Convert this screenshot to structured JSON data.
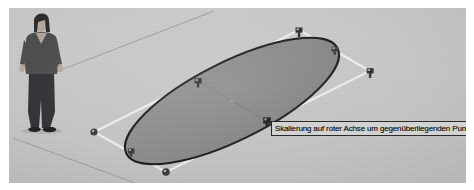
{
  "application": {
    "name": "SketchUp",
    "tool": "scale-tool",
    "language": "de"
  },
  "tooltip": {
    "text": "Skalierung auf roter Achse um gegenüberliegenden Punkt",
    "background_color": "#d2d2d2",
    "border_color": "#2a2a2a",
    "text_color": "#1a1a1a"
  },
  "viewport": {
    "background_color": "#c9c9c9",
    "page_background_color": "#ffffff",
    "ground_line_color": "#8d8d8d"
  },
  "scale_figure": {
    "label": "human-scale-figure",
    "description": "stehende Person",
    "sweater_color": "#4a4a4a",
    "trousers_color": "#2f3034",
    "skin_color": "#b9aca2",
    "hair_color": "#2b2b2b",
    "shoes_color": "#26262a"
  },
  "selection": {
    "label": "ellipse-face",
    "fill_color": "#8b8b8b",
    "edge_color": "#1c1c1c",
    "bounding_box_color": "#f0f0f0",
    "axis_guide_color": "#7a7a7a"
  },
  "scale_grips": [
    {
      "id": "grip-top-mid",
      "type": "cube",
      "state": "idle",
      "x": 290,
      "y": 22
    },
    {
      "id": "grip-top-right",
      "type": "cube",
      "state": "idle",
      "x": 326,
      "y": 41
    },
    {
      "id": "grip-right-mid",
      "type": "cube",
      "state": "idle",
      "x": 361,
      "y": 63
    },
    {
      "id": "grip-left-mid",
      "type": "cube",
      "state": "idle",
      "x": 189,
      "y": 73
    },
    {
      "id": "grip-active-red",
      "type": "cube",
      "state": "active",
      "x": 258,
      "y": 113
    },
    {
      "id": "grip-bottom-left",
      "type": "circle",
      "state": "idle",
      "x": 85,
      "y": 124
    },
    {
      "id": "grip-bottom-mid-left",
      "type": "cube",
      "state": "idle",
      "x": 122,
      "y": 144
    },
    {
      "id": "grip-bottom-mid",
      "type": "circle",
      "state": "idle",
      "x": 157,
      "y": 164
    }
  ],
  "geometry": {
    "bounding_box_points": "85,124 290,22 361,63 157,164",
    "ellipse": {
      "cx": 223,
      "cy": 93,
      "rx": 118,
      "ry": 39,
      "rotation_deg": -26.5
    },
    "ground_lines": [
      {
        "id": "ground-line-upper",
        "x1": 26,
        "y1": 72,
        "x2": 200,
        "y2": 4
      },
      {
        "id": "ground-line-lower",
        "x1": 8,
        "y1": 132,
        "x2": 122,
        "y2": 175
      }
    ],
    "inner_axis_lines": [
      {
        "id": "axis-red",
        "x1": 189,
        "y1": 73,
        "x2": 258,
        "y2": 113
      },
      {
        "id": "axis-green",
        "x1": 223,
        "y1": 93,
        "x2": 258,
        "y2": 113
      }
    ]
  }
}
